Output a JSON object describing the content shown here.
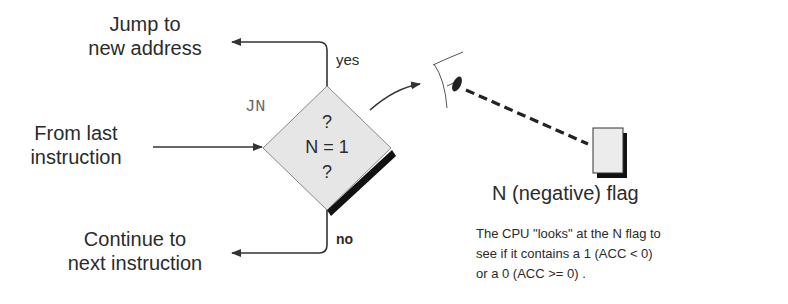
{
  "labels": {
    "jump_line1": "Jump to",
    "jump_line2": "new address",
    "from_line1": "From last",
    "from_line2": "instruction",
    "continue_line1": "Continue to",
    "continue_line2": "next instruction",
    "yes": "yes",
    "no": "no",
    "instruction": "JN"
  },
  "decision": {
    "q_top": "?",
    "condition": "N = 1",
    "q_bottom": "?"
  },
  "flag": {
    "label": "N (negative) flag"
  },
  "description": {
    "line1": "The CPU \"looks\" at the N flag to",
    "line2": "see if it contains a 1 (ACC < 0)",
    "line3": "or a 0 (ACC >= 0) ."
  },
  "colors": {
    "line": "#333333",
    "diamond_fill": "#e6e6e6",
    "shadow": "#111111",
    "flag_fill": "#ececec"
  }
}
